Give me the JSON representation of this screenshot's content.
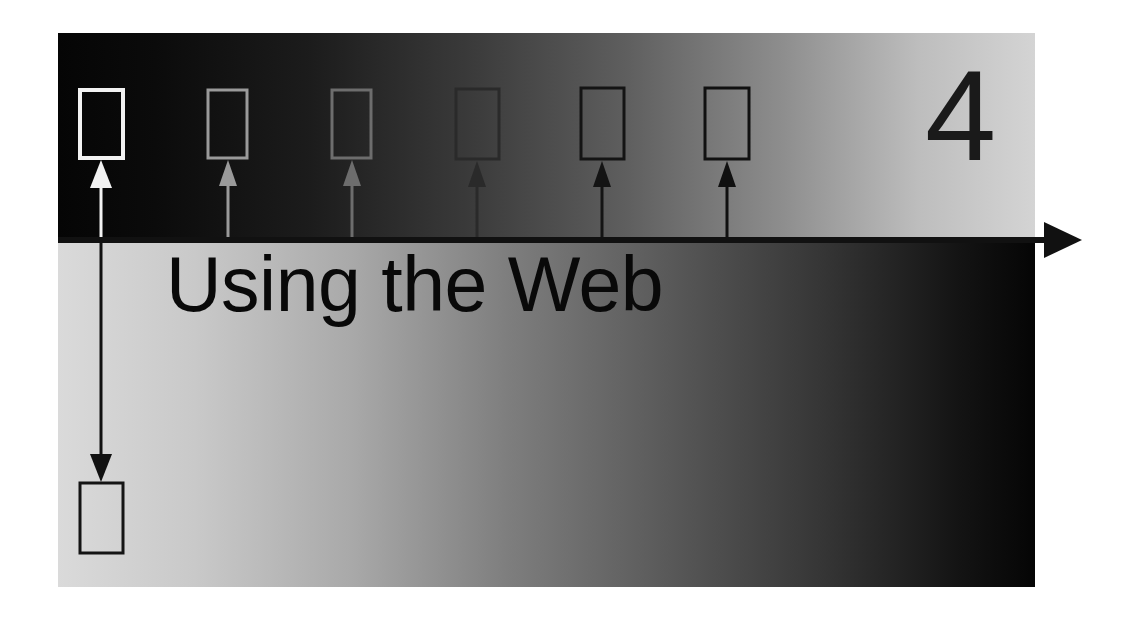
{
  "slide": {
    "chapter_number": "4",
    "title": "Using the Web",
    "background_color": "#ffffff"
  },
  "panel": {
    "x": 58,
    "y": 33,
    "width": 977,
    "height": 554,
    "divider_y": 240,
    "upper_band": {
      "name": "upper-gradient-band",
      "gradient_from": "#080808",
      "gradient_to": "#d2d2d2",
      "direction": "left-to-right"
    },
    "lower_band": {
      "name": "lower-gradient-band",
      "gradient_from": "#d7d7d7",
      "gradient_to": "#080808",
      "direction": "left-to-right"
    }
  },
  "axis_arrow": {
    "name": "horizontal-axis-arrow",
    "y": 240,
    "x_start": 58,
    "x_end": 1082,
    "color": "#111111",
    "head_width": 34,
    "head_height": 30
  },
  "nodes": [
    {
      "id": "node-1",
      "label": "",
      "x": 80,
      "y": 90,
      "width": 43,
      "height": 68,
      "stroke": "#f2f2f2",
      "stroke_width": 4,
      "fill": "none"
    },
    {
      "id": "node-2",
      "label": "",
      "x": 208,
      "y": 90,
      "width": 39,
      "height": 68,
      "stroke": "#9a9a9a",
      "stroke_width": 3,
      "fill": "none"
    },
    {
      "id": "node-3",
      "label": "",
      "x": 332,
      "y": 90,
      "width": 39,
      "height": 68,
      "stroke": "#6d6d6d",
      "stroke_width": 3,
      "fill": "none"
    },
    {
      "id": "node-4",
      "label": "",
      "x": 456,
      "y": 89,
      "width": 43,
      "height": 70,
      "stroke": "#2a2a2a",
      "stroke_width": 3,
      "fill": "none"
    },
    {
      "id": "node-5",
      "label": "",
      "x": 581,
      "y": 88,
      "width": 43,
      "height": 71,
      "stroke": "#141414",
      "stroke_width": 3,
      "fill": "none"
    },
    {
      "id": "node-6",
      "label": "",
      "x": 705,
      "y": 88,
      "width": 44,
      "height": 71,
      "stroke": "#101010",
      "stroke_width": 3,
      "fill": "none"
    },
    {
      "id": "node-7",
      "label": "",
      "x": 80,
      "y": 483,
      "width": 43,
      "height": 70,
      "stroke": "#141414",
      "stroke_width": 3,
      "fill": "none"
    }
  ],
  "connectors": [
    {
      "id": "connector-up-1",
      "direction": "up",
      "x": 101,
      "y_from": 240,
      "y_to": 160,
      "color": "#f2f2f2",
      "line_width": 3,
      "head_width": 22,
      "head_height": 26
    },
    {
      "id": "connector-up-2",
      "direction": "up",
      "x": 228,
      "y_from": 240,
      "y_to": 160,
      "color": "#9a9a9a",
      "line_width": 3,
      "head_width": 18,
      "head_height": 24
    },
    {
      "id": "connector-up-3",
      "direction": "up",
      "x": 352,
      "y_from": 240,
      "y_to": 160,
      "color": "#6d6d6d",
      "line_width": 3,
      "head_width": 18,
      "head_height": 24
    },
    {
      "id": "connector-up-4",
      "direction": "up",
      "x": 477,
      "y_from": 240,
      "y_to": 161,
      "color": "#2a2a2a",
      "line_width": 3,
      "head_width": 18,
      "head_height": 24
    },
    {
      "id": "connector-up-5",
      "direction": "up",
      "x": 602,
      "y_from": 240,
      "y_to": 161,
      "color": "#141414",
      "line_width": 3,
      "head_width": 18,
      "head_height": 24
    },
    {
      "id": "connector-up-6",
      "direction": "up",
      "x": 727,
      "y_from": 240,
      "y_to": 161,
      "color": "#101010",
      "line_width": 3,
      "head_width": 18,
      "head_height": 24
    },
    {
      "id": "connector-down-1",
      "direction": "down",
      "x": 101,
      "y_from": 240,
      "y_to": 482,
      "color": "#111111",
      "line_width": 3,
      "head_width": 22,
      "head_height": 26
    }
  ],
  "title_text": {
    "content": "Using the Web",
    "x": 166,
    "baseline_y": 311,
    "font_size": 77,
    "color": "#090909"
  },
  "chapter_text": {
    "content": "4",
    "x": 925,
    "baseline_y": 160,
    "font_size": 128,
    "color": "#1a1a1a"
  }
}
